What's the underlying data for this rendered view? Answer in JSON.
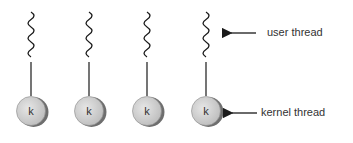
{
  "diagram": {
    "threads": [
      {
        "user_x": 31,
        "kernel_label": "k"
      },
      {
        "user_x": 89,
        "kernel_label": "k"
      },
      {
        "user_x": 147,
        "kernel_label": "k"
      },
      {
        "user_x": 206,
        "kernel_label": "k"
      }
    ],
    "annotations": {
      "user_thread": "user thread",
      "kernel_thread": "kernel thread"
    },
    "colors": {
      "stroke": "#1a1a1a",
      "circle_fill": "#d4d4d4",
      "circle_shadow": "#6e6e6e",
      "text": "#333333"
    }
  }
}
